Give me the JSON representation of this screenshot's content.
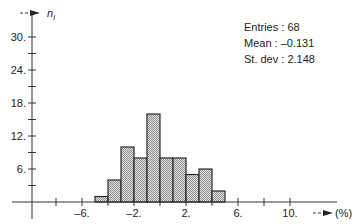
{
  "chart_data": {
    "type": "bar",
    "subtype": "histogram",
    "title": "",
    "xlabel": "(%)",
    "ylabel": "n_i",
    "ylabel_display": {
      "main": "n",
      "sub": "i"
    },
    "bin_width": 1,
    "bin_edges": [
      -5,
      -4,
      -3,
      -2,
      -1,
      0,
      1,
      2,
      3,
      4,
      5
    ],
    "categories": [
      "[-5,-4)",
      "[-4,-3)",
      "[-3,-2)",
      "[-2,-1)",
      "[-1,0)",
      "[0,1)",
      "[1,2)",
      "[2,3)",
      "[3,4)",
      "[4,5)"
    ],
    "values": [
      1,
      4,
      10,
      8,
      16,
      8,
      8,
      5,
      6,
      2
    ],
    "xlim": [
      -10,
      13
    ],
    "ylim": [
      0,
      33
    ],
    "x_ticks": [
      -10,
      -8,
      -6,
      -4,
      -2,
      0,
      2,
      4,
      6,
      8,
      10
    ],
    "x_tick_labels": [
      {
        "value": -6,
        "label": "–6."
      },
      {
        "value": -2,
        "label": "–2."
      },
      {
        "value": 2,
        "label": "2."
      },
      {
        "value": 6,
        "label": "6."
      },
      {
        "value": 10,
        "label": "10."
      }
    ],
    "y_ticks": [
      3,
      6,
      9,
      12,
      15,
      18,
      21,
      24,
      27,
      30
    ],
    "y_tick_labels": [
      {
        "value": 6,
        "label": "6."
      },
      {
        "value": 12,
        "label": "12."
      },
      {
        "value": 18,
        "label": "18."
      },
      {
        "value": 24,
        "label": "24."
      },
      {
        "value": 30,
        "label": "30."
      }
    ],
    "grid": false,
    "fill_pattern": "dotted-gray",
    "annotations": {
      "entries": "Entries : 68",
      "mean": "Mean : –0.131",
      "stdev": "St. dev : 2.148"
    }
  },
  "axes": {
    "x_arrow_label": "- - ►",
    "y_arrow_label": "- -"
  },
  "colors": {
    "axis": "#333333",
    "bar_stroke": "#2a2a2a",
    "bar_fill_bg": "#e6e6e6",
    "bar_fill_dot": "#8a8a8a",
    "text": "#222222"
  }
}
